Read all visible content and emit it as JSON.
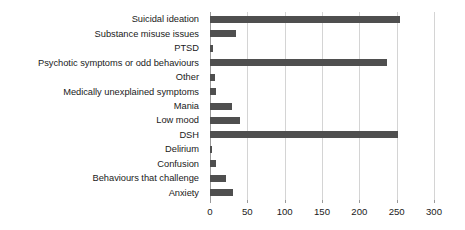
{
  "chart_data": {
    "type": "bar",
    "orientation": "horizontal",
    "title": "",
    "subtitle": "",
    "xlabel": "",
    "ylabel": "",
    "xlim": [
      0,
      300
    ],
    "xticks": [
      0,
      50,
      100,
      150,
      200,
      250,
      300
    ],
    "xtick_labels": [
      "0",
      "50",
      "100",
      "150",
      "200",
      "250",
      "300"
    ],
    "grid": true,
    "grid_axis": "x",
    "legend": false,
    "legend_position": "none",
    "bar_color": "#4f4f4f",
    "gridline_color": "#d4d4d4",
    "axis_color": "#9a9a9a",
    "categories": [
      "Suicidal ideation",
      "Substance misuse issues",
      "PTSD",
      "Psychotic symptoms or odd behaviours",
      "Other",
      "Medically unexplained symptoms",
      "Mania",
      "Low mood",
      "DSH",
      "Delirium",
      "Confusion",
      "Behaviours that challenge",
      "Anxiety"
    ],
    "values": [
      254,
      35,
      4,
      237,
      7,
      8,
      30,
      40,
      252,
      3,
      8,
      22,
      31
    ]
  }
}
